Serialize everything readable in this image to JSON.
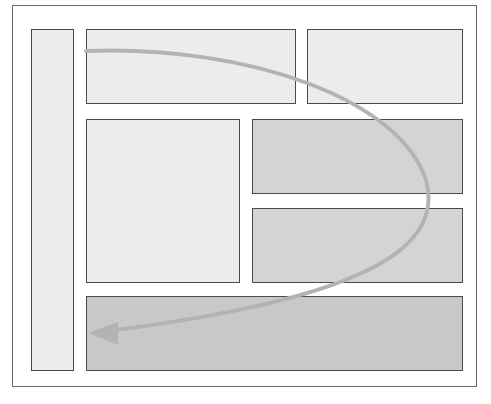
{
  "diagram": {
    "type": "page-layout-reading-flow",
    "frame": {
      "label": ""
    },
    "panels": [
      {
        "id": "sidebar",
        "shade": "light"
      },
      {
        "id": "top-left",
        "shade": "light"
      },
      {
        "id": "top-right",
        "shade": "light"
      },
      {
        "id": "main-left",
        "shade": "light"
      },
      {
        "id": "middle-right-upper",
        "shade": "mid"
      },
      {
        "id": "middle-right-lower",
        "shade": "mid"
      },
      {
        "id": "bottom",
        "shade": "dark"
      }
    ],
    "flow_arrow": {
      "description": "curved arrow from top-left panel sweeping right and down to bottom panel",
      "color": "#b3b3b3",
      "start": [
        86,
        51
      ],
      "end": [
        88,
        333
      ]
    }
  },
  "colors": {
    "panel_light": "#ececec",
    "panel_mid": "#d4d4d4",
    "panel_dark": "#c8c8c8",
    "border": "#4a4a4a",
    "arrow": "#b3b3b3"
  }
}
